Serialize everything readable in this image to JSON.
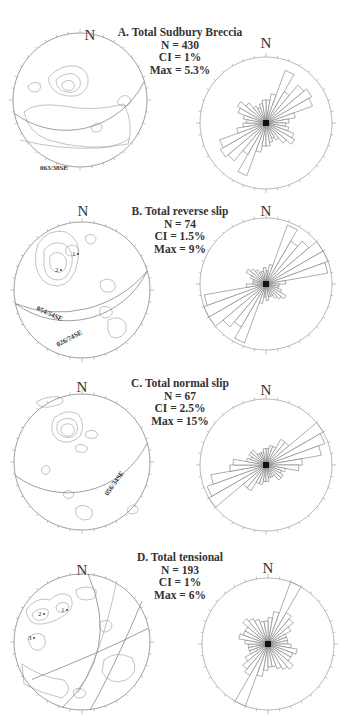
{
  "figure": {
    "panels": [
      {
        "id": "A",
        "title": "A.  Total Sudbury Breccia",
        "n_line": "N = 430",
        "ci_line": "CI = 1%",
        "max_line": "Max = 5.3%",
        "north_label": "N",
        "stereonet": {
          "cx": 80,
          "cy": 100,
          "r": 67,
          "north_x": 89,
          "planes": [
            {
              "label": "063/38SE",
              "label_x": 40,
              "label_y": 170,
              "label_rot": 0
            }
          ],
          "point_labels": []
        },
        "rose": {
          "cx": 266,
          "cy": 123,
          "r": 66
        }
      },
      {
        "id": "B",
        "title": "B.  Total reverse slip",
        "n_line": "N = 74",
        "ci_line": "CI = 1.5%",
        "max_line": "Max = 9%",
        "north_label": "N",
        "stereonet": {
          "cx": 82,
          "cy": 290,
          "r": 68,
          "north_x": 83,
          "planes": [
            {
              "label": "054/54SE",
              "label_x": 36,
              "label_y": 310,
              "label_rot": 24
            },
            {
              "label": "026/74SE",
              "label_x": 58,
              "label_y": 347,
              "label_rot": -28
            }
          ],
          "point_labels": [
            {
              "text": "1",
              "x": 72,
              "y": 256
            },
            {
              "text": "2",
              "x": 55,
              "y": 272
            }
          ]
        },
        "rose": {
          "cx": 266,
          "cy": 284,
          "r": 66
        }
      },
      {
        "id": "C",
        "title": "C.  Total normal slip",
        "n_line": "N = 67",
        "ci_line": "CI = 2.5%",
        "max_line": "Max = 15%",
        "north_label": "N",
        "stereonet": {
          "cx": 82,
          "cy": 462,
          "r": 68,
          "north_x": 82,
          "planes": [
            {
              "label": "056/34SE",
              "label_x": 108,
              "label_y": 496,
              "label_rot": -55
            }
          ],
          "point_labels": []
        },
        "rose": {
          "cx": 266,
          "cy": 465,
          "r": 66
        }
      },
      {
        "id": "D",
        "title": "D.  Total tensional",
        "n_line": "N = 193",
        "ci_line": "CI = 1%",
        "max_line": "Max = 6%",
        "north_label": "N",
        "stereonet": {
          "cx": 82,
          "cy": 642,
          "r": 68,
          "north_x": 82,
          "planes": [],
          "point_labels": [
            {
              "text": "1",
              "x": 61,
              "y": 612
            },
            {
              "text": "2",
              "x": 38,
              "y": 616
            },
            {
              "text": "3",
              "x": 28,
              "y": 640
            }
          ]
        },
        "rose": {
          "cx": 268,
          "cy": 644,
          "r": 66
        }
      }
    ]
  },
  "chart_data": [
    {
      "type": "rose",
      "title": "A. Total Sudbury Breccia",
      "annotations": [
        "N = 430",
        "CI = 1%",
        "Max = 5.3%",
        "063/38SE"
      ],
      "bin_width_deg": 10,
      "bidirectional": true,
      "bins_deg": [
        0,
        10,
        20,
        30,
        40,
        50,
        60,
        70,
        80,
        90,
        100,
        110,
        120,
        130,
        140,
        150,
        160,
        170
      ],
      "values": [
        0.35,
        0.45,
        0.85,
        0.55,
        0.75,
        0.8,
        0.75,
        0.45,
        0.35,
        0.3,
        0.35,
        0.45,
        0.5,
        0.4,
        0.3,
        0.25,
        0.3,
        0.35
      ]
    },
    {
      "type": "rose",
      "title": "B. Total reverse slip",
      "annotations": [
        "N = 74",
        "CI = 1.5%",
        "Max = 9%",
        "054/54SE",
        "026/74SE"
      ],
      "bin_width_deg": 10,
      "bidirectional": true,
      "bins_deg": [
        0,
        10,
        20,
        30,
        40,
        50,
        60,
        70,
        80,
        90,
        100,
        110,
        120,
        130,
        140,
        150,
        160,
        170
      ],
      "values": [
        0.2,
        0.3,
        0.95,
        0.75,
        0.85,
        1.0,
        1.0,
        0.95,
        0.3,
        0.2,
        0.2,
        0.25,
        0.35,
        0.3,
        0.25,
        0.2,
        0.2,
        0.25
      ]
    },
    {
      "type": "rose",
      "title": "C. Total normal slip",
      "annotations": [
        "N = 67",
        "CI = 2.5%",
        "Max = 15%",
        "056/34SE"
      ],
      "bin_width_deg": 10,
      "bidirectional": true,
      "bins_deg": [
        0,
        10,
        20,
        30,
        40,
        50,
        60,
        70,
        80,
        90,
        100,
        110,
        120,
        130,
        140,
        150,
        160,
        170
      ],
      "values": [
        0.25,
        0.3,
        0.3,
        0.45,
        0.45,
        1.0,
        0.95,
        0.85,
        0.55,
        0.5,
        0.3,
        0.25,
        0.3,
        0.3,
        0.2,
        0.2,
        0.2,
        0.25
      ]
    },
    {
      "type": "rose",
      "title": "D. Total tensional",
      "annotations": [
        "N = 193",
        "CI = 1%",
        "Max = 6%"
      ],
      "bin_width_deg": 10,
      "bidirectional": true,
      "bins_deg": [
        0,
        10,
        20,
        30,
        40,
        50,
        60,
        70,
        80,
        90,
        100,
        110,
        120,
        130,
        140,
        150,
        160,
        170
      ],
      "values": [
        0.4,
        0.5,
        1.0,
        0.55,
        0.5,
        0.4,
        0.3,
        0.3,
        0.3,
        0.35,
        0.45,
        0.4,
        0.4,
        0.5,
        0.45,
        0.4,
        0.35,
        0.35
      ]
    }
  ]
}
